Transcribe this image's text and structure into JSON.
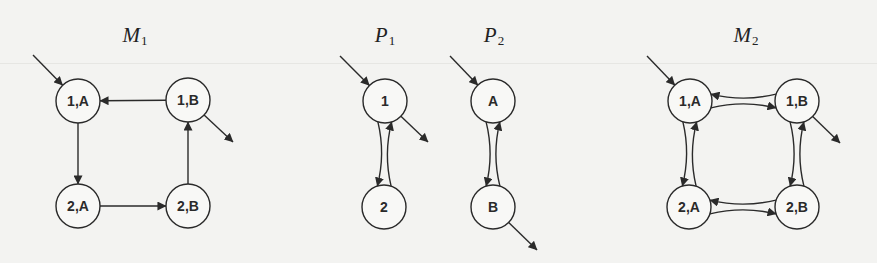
{
  "background": "#f3f3f1",
  "stroke_color": "#2a2a2a",
  "node_radius": 22,
  "diagrams": [
    {
      "id": "M1",
      "title": {
        "base": "M",
        "sub": "1",
        "x": 135,
        "y": 36
      },
      "nodes": [
        {
          "id": "1A",
          "label": "1,A",
          "x": 78,
          "y": 101
        },
        {
          "id": "1B",
          "label": "1,B",
          "x": 188,
          "y": 100
        },
        {
          "id": "2A",
          "label": "2,A",
          "x": 78,
          "y": 206
        },
        {
          "id": "2B",
          "label": "2,B",
          "x": 188,
          "y": 206
        }
      ],
      "edges": [
        {
          "from": "1B",
          "to": "1A",
          "curve": 0
        },
        {
          "from": "1A",
          "to": "2A",
          "curve": 0
        },
        {
          "from": "2A",
          "to": "2B",
          "curve": 0
        },
        {
          "from": "2B",
          "to": "1B",
          "curve": 0
        }
      ],
      "entry": {
        "node": "1A",
        "from": [
          33,
          55
        ]
      },
      "exit": {
        "node": "1B",
        "to": [
          233,
          142
        ]
      }
    },
    {
      "id": "P1",
      "title": {
        "base": "P",
        "sub": "1",
        "x": 385,
        "y": 36
      },
      "nodes": [
        {
          "id": "1",
          "label": "1",
          "x": 385,
          "y": 101
        },
        {
          "id": "2",
          "label": "2",
          "x": 384,
          "y": 207
        }
      ],
      "edges": [
        {
          "from": "1",
          "to": "2",
          "curve": -8
        },
        {
          "from": "2",
          "to": "1",
          "curve": -8
        }
      ],
      "entry": {
        "node": "1",
        "from": [
          340,
          56
        ]
      },
      "exit": {
        "node": "1",
        "to": [
          428,
          142
        ]
      }
    },
    {
      "id": "P2",
      "title": {
        "base": "P",
        "sub": "2",
        "x": 494,
        "y": 36
      },
      "nodes": [
        {
          "id": "A",
          "label": "A",
          "x": 493,
          "y": 101
        },
        {
          "id": "B",
          "label": "B",
          "x": 493,
          "y": 207
        }
      ],
      "edges": [
        {
          "from": "A",
          "to": "B",
          "curve": -8
        },
        {
          "from": "B",
          "to": "A",
          "curve": -8
        }
      ],
      "entry": {
        "node": "A",
        "from": [
          450,
          56
        ]
      },
      "exit": {
        "node": "B",
        "to": [
          537,
          250
        ]
      }
    },
    {
      "id": "M2",
      "title": {
        "base": "M",
        "sub": "2",
        "x": 746,
        "y": 36
      },
      "nodes": [
        {
          "id": "1A",
          "label": "1,A",
          "x": 690,
          "y": 101
        },
        {
          "id": "1B",
          "label": "1,B",
          "x": 797,
          "y": 101
        },
        {
          "id": "2A",
          "label": "2,A",
          "x": 689,
          "y": 207
        },
        {
          "id": "2B",
          "label": "2,B",
          "x": 797,
          "y": 207
        }
      ],
      "edges": [
        {
          "from": "1A",
          "to": "1B",
          "curve": -8
        },
        {
          "from": "1B",
          "to": "1A",
          "curve": -8
        },
        {
          "from": "1A",
          "to": "2A",
          "curve": -8
        },
        {
          "from": "2A",
          "to": "1A",
          "curve": -8
        },
        {
          "from": "1B",
          "to": "2B",
          "curve": -8
        },
        {
          "from": "2B",
          "to": "1B",
          "curve": -8
        },
        {
          "from": "2A",
          "to": "2B",
          "curve": -8
        },
        {
          "from": "2B",
          "to": "2A",
          "curve": -8
        }
      ],
      "entry": {
        "node": "1A",
        "from": [
          647,
          56
        ]
      },
      "exit": {
        "node": "1B",
        "to": [
          840,
          143
        ]
      }
    }
  ]
}
